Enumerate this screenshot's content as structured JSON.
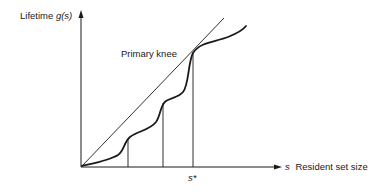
{
  "diagram": {
    "y_axis": {
      "label": "Lifetime",
      "symbol": "g(s)"
    },
    "x_axis": {
      "symbol": "s",
      "label": "Resident set size"
    },
    "annotations": {
      "knee_label": "Primary knee",
      "s_star": "s*"
    },
    "colors": {
      "ink": "#1a1a1a",
      "background": "#ffffff"
    },
    "elements": [
      "y-axis arrow",
      "x-axis arrow",
      "lifetime curve g(s) with multiple knees",
      "tangent line from origin to primary knee",
      "vertical drop lines at knees",
      "primary knee at s*"
    ]
  }
}
